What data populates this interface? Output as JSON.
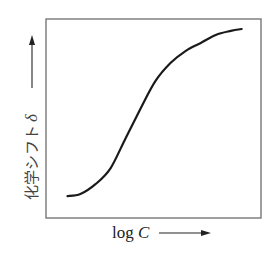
{
  "chart_data": {
    "type": "line",
    "title": "",
    "xlabel": "log C",
    "xlabel_text": "log ",
    "xlabel_var": "C",
    "ylabel": "化学シフト δ",
    "ylabel_text": "化学シフト",
    "ylabel_var": "δ",
    "xlim": [
      0,
      1
    ],
    "ylim": [
      0,
      1
    ],
    "grid": false,
    "legend": null,
    "axis_ticks": "none",
    "series": [
      {
        "name": "chemical-shift-curve",
        "x": [
          0.1,
          0.16,
          0.23,
          0.3,
          0.37,
          0.44,
          0.51,
          0.58,
          0.65,
          0.72,
          0.79,
          0.86,
          0.91
        ],
        "y": [
          0.11,
          0.12,
          0.17,
          0.25,
          0.4,
          0.55,
          0.69,
          0.78,
          0.84,
          0.88,
          0.92,
          0.94,
          0.95
        ]
      }
    ]
  }
}
